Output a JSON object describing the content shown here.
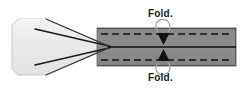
{
  "figure": {
    "labels": {
      "top_fold": "Fold.",
      "bottom_fold": "Fold."
    },
    "colors": {
      "flat_sheet_fill": "#e8e8e8",
      "flat_sheet_edge_light": "#f5f5f5",
      "folded_band_fill": "#8a8a8a",
      "folded_band_edge": "#6f6f6f",
      "line_stroke": "#1a1a1a",
      "dashed_line": "#1a1a1a",
      "arc_stroke": "#9a9a9a",
      "background": "#ffffff",
      "label_text": "#1a1a1a"
    },
    "geometry": {
      "width": 250,
      "height": 91,
      "sheet_left_x": 12,
      "sheet_top_y": 19,
      "sheet_bottom_y": 75,
      "sheet_corner_inset": 6,
      "apex_x": 108,
      "apex_y": 47,
      "band_left_x": 97,
      "band_right_x": 236,
      "band_top_y": 28,
      "band_bottom_y": 66,
      "band_centerline_y": 47,
      "fold_line_top_y": 34,
      "fold_line_bottom_y": 60,
      "arrow_x": 163
    },
    "elements": {
      "flat_sheet": "flat-sheet-polygon",
      "taper_top_line": "taper-crease-top",
      "taper_bottom_line": "taper-crease-bottom",
      "folded_band": "folded-band-rect",
      "centerline": "band-centerline",
      "top_fold_dash": "top-fold-dashed-line",
      "bottom_fold_dash": "bottom-fold-dashed-line",
      "top_arrow": "top-fold-arrow",
      "bottom_arrow": "bottom-fold-arrow",
      "top_arc": "top-fold-arc",
      "bottom_arc": "bottom-fold-arc"
    }
  }
}
